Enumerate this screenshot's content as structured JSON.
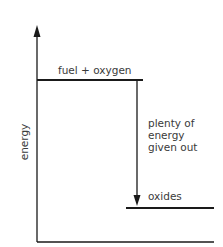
{
  "diagram": {
    "type": "energy-level-diagram",
    "axis": {
      "y_label": "energy"
    },
    "levels": [
      {
        "label": "fuel + oxygen",
        "position": "high"
      },
      {
        "label": "oxides",
        "position": "low"
      }
    ],
    "arrow": {
      "direction": "down",
      "label_lines": [
        "plenty of",
        "energy",
        "given out"
      ]
    },
    "colors": {
      "line": "#1a1a1a",
      "text": "#3a3a3a",
      "background": "#ffffff"
    }
  }
}
